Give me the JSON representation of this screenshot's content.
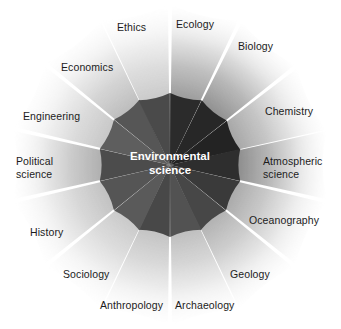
{
  "figure": {
    "center": {
      "label": "Environmental\nscience",
      "text_color": "#ffffff"
    },
    "background_color": "#ffffff",
    "geometry": {
      "cx": 170,
      "cy": 165,
      "inner_radius": 72,
      "outer_radius": 160,
      "segment_count": 14
    },
    "sectors": [
      {
        "label": "Ecology",
        "angle_deg": 77,
        "inner_color": "#2b2b2b",
        "outer_color": "#9a9a9a",
        "label_x": 176,
        "label_y": 18,
        "align": "left"
      },
      {
        "label": "Biology",
        "angle_deg": 51,
        "inner_color": "#272727",
        "outer_color": "#8e8e8e",
        "label_x": 238,
        "label_y": 40,
        "align": "left"
      },
      {
        "label": "Chemistry",
        "angle_deg": 25,
        "inner_color": "#232323",
        "outer_color": "#a4a4a4",
        "label_x": 265,
        "label_y": 105,
        "align": "left"
      },
      {
        "label": "Atmospheric\nscience",
        "angle_deg": 0,
        "inner_color": "#2e2e2e",
        "outer_color": "#8b8b8b",
        "label_x": 263,
        "label_y": 155,
        "align": "left"
      },
      {
        "label": "Oceanography",
        "angle_deg": -26,
        "inner_color": "#3a3a3a",
        "outer_color": "#a8a8a8",
        "label_x": 249,
        "label_y": 214,
        "align": "left"
      },
      {
        "label": "Geology",
        "angle_deg": -52,
        "inner_color": "#474747",
        "outer_color": "#b0b0b0",
        "label_x": 230,
        "label_y": 268,
        "align": "left"
      },
      {
        "label": "Archaeology",
        "angle_deg": -77,
        "inner_color": "#525252",
        "outer_color": "#bdbdbd",
        "label_x": 175,
        "label_y": 299,
        "align": "left"
      },
      {
        "label": "Anthropology",
        "angle_deg": -103,
        "inner_color": "#484848",
        "outer_color": "#c2c2c2",
        "label_x": 100,
        "label_y": 299,
        "align": "left"
      },
      {
        "label": "Sociology",
        "angle_deg": -128,
        "inner_color": "#5a5a5a",
        "outer_color": "#c8c8c8",
        "label_x": 63,
        "label_y": 268,
        "align": "left"
      },
      {
        "label": "History",
        "angle_deg": -154,
        "inner_color": "#555555",
        "outer_color": "#c0c0c0",
        "label_x": 30,
        "label_y": 226,
        "align": "left"
      },
      {
        "label": "Political\nscience",
        "angle_deg": 180,
        "inner_color": "#4c4c4c",
        "outer_color": "#adadad",
        "label_x": 16,
        "label_y": 155,
        "align": "left"
      },
      {
        "label": "Engineering",
        "angle_deg": 154,
        "inner_color": "#5e5e5e",
        "outer_color": "#c6c6c6",
        "label_x": 23,
        "label_y": 110,
        "align": "left"
      },
      {
        "label": "Economics",
        "angle_deg": 128,
        "inner_color": "#565656",
        "outer_color": "#bbbbbb",
        "label_x": 61,
        "label_y": 61,
        "align": "left"
      },
      {
        "label": "Ethics",
        "angle_deg": 103,
        "inner_color": "#4a4a4a",
        "outer_color": "#c9c9c9",
        "label_x": 117,
        "label_y": 21,
        "align": "left"
      }
    ]
  }
}
